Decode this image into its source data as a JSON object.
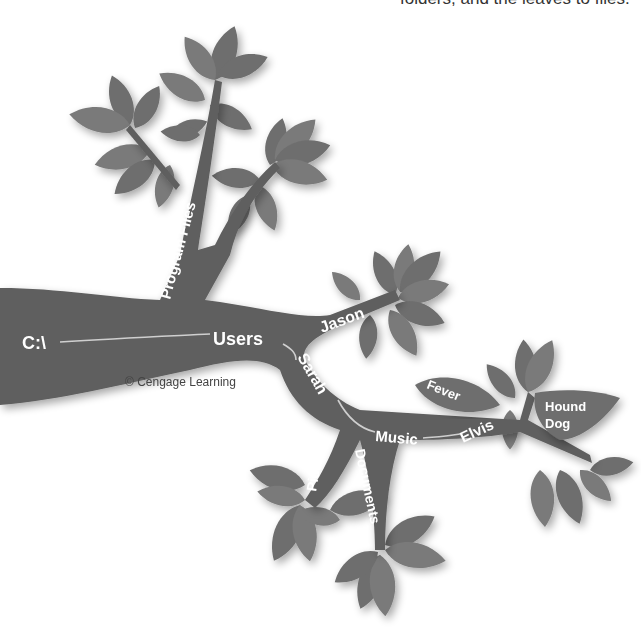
{
  "caption": {
    "top_text": "folders, and the leaves to files."
  },
  "tree": {
    "root": "C:\\",
    "folders": {
      "program_files": "Program Files",
      "users": "Users",
      "jason": "Jason",
      "sarah": "Sarah",
      "music": "Music",
      "elvis": "Elvis",
      "pictures": "Pictures",
      "documents": "Documents"
    },
    "files": {
      "fever": "Fever",
      "hound_dog_line1": "Hound",
      "hound_dog_line2": "Dog"
    }
  },
  "credit": "© Cengage Learning",
  "colors": {
    "branch": "#5f5f5f",
    "leaf": "#6e6e6e",
    "label": "#ffffff",
    "path_line": "#cfcfcf"
  }
}
